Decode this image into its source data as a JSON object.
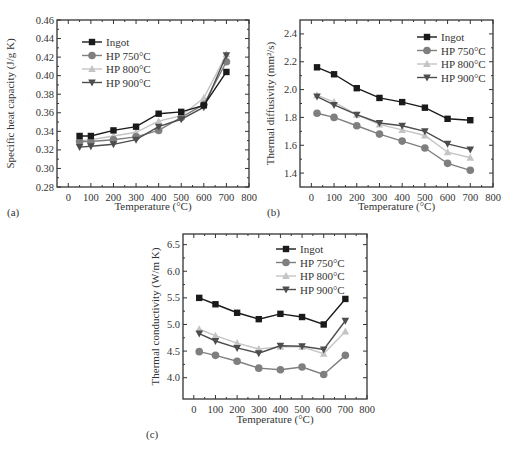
{
  "colors": {
    "Ingot": "#1a1a1a",
    "HP 750°C": "#7f7f7f",
    "HP 800°C": "#c4c4c4",
    "HP 900°C": "#4d4d4d",
    "axis": "#333333"
  },
  "chart_data": [
    {
      "panel": "(a)",
      "type": "line",
      "title": "",
      "xlabel": "Temperature (°C)",
      "ylabel": "Specific heat capacity (J/g K)",
      "xlim": [
        -50,
        800
      ],
      "ylim": [
        0.28,
        0.46
      ],
      "xticks": [
        0,
        100,
        200,
        300,
        400,
        500,
        600,
        700,
        800
      ],
      "yticks": [
        0.28,
        0.3,
        0.32,
        0.34,
        0.36,
        0.38,
        0.4,
        0.42,
        0.44,
        0.46
      ],
      "ytick_labels": [
        "0.28",
        "0.30",
        "0.32",
        "0.34",
        "0.36",
        "0.38",
        "0.40",
        "0.42",
        "0.44",
        "0.46"
      ],
      "grid": false,
      "legend_position": "upper left",
      "x": [
        50,
        100,
        200,
        300,
        400,
        500,
        600,
        700
      ],
      "series": [
        {
          "name": "Ingot",
          "marker": "square",
          "values": [
            0.335,
            0.335,
            0.341,
            0.345,
            0.359,
            0.361,
            0.368,
            0.404
          ]
        },
        {
          "name": "HP 750°C",
          "marker": "circle",
          "values": [
            0.329,
            0.329,
            0.331,
            0.334,
            0.341,
            0.355,
            0.369,
            0.415
          ]
        },
        {
          "name": "HP 800°C",
          "marker": "triangle-up",
          "values": [
            0.33,
            0.331,
            0.335,
            0.339,
            0.351,
            0.357,
            0.376,
            0.423
          ]
        },
        {
          "name": "HP 900°C",
          "marker": "triangle-down",
          "values": [
            0.323,
            0.324,
            0.326,
            0.331,
            0.345,
            0.353,
            0.366,
            0.422
          ]
        }
      ]
    },
    {
      "panel": "(b)",
      "type": "line",
      "title": "",
      "xlabel": "Temperature (°C)",
      "ylabel": "Thermal diffusivity (mm²/s)",
      "xlim": [
        -50,
        800
      ],
      "ylim": [
        1.3,
        2.5
      ],
      "xticks": [
        0,
        100,
        200,
        300,
        400,
        500,
        600,
        700,
        800
      ],
      "yticks": [
        1.4,
        1.6,
        1.8,
        2.0,
        2.2,
        2.4
      ],
      "ytick_labels": [
        "1.4",
        "1.6",
        "1.8",
        "2.0",
        "2.2",
        "2.4"
      ],
      "grid": false,
      "legend_position": "upper right",
      "x": [
        25,
        100,
        200,
        300,
        400,
        500,
        600,
        700
      ],
      "series": [
        {
          "name": "Ingot",
          "marker": "square",
          "values": [
            2.16,
            2.11,
            2.01,
            1.94,
            1.91,
            1.87,
            1.79,
            1.78
          ]
        },
        {
          "name": "HP 750°C",
          "marker": "circle",
          "values": [
            1.83,
            1.8,
            1.74,
            1.68,
            1.63,
            1.58,
            1.47,
            1.42
          ]
        },
        {
          "name": "HP 800°C",
          "marker": "triangle-up",
          "values": [
            1.96,
            1.91,
            1.82,
            1.75,
            1.71,
            1.67,
            1.55,
            1.51
          ]
        },
        {
          "name": "HP 900°C",
          "marker": "triangle-down",
          "values": [
            1.95,
            1.89,
            1.82,
            1.76,
            1.74,
            1.7,
            1.61,
            1.57
          ]
        }
      ]
    },
    {
      "panel": "(c)",
      "type": "line",
      "title": "",
      "xlabel": "Temperature (°C)",
      "ylabel": "Thermal conductivity (W/m K)",
      "xlim": [
        -50,
        800
      ],
      "ylim": [
        3.6,
        6.7
      ],
      "xticks": [
        0,
        100,
        200,
        300,
        400,
        500,
        600,
        700,
        800
      ],
      "yticks": [
        4.0,
        4.5,
        5.0,
        5.5,
        6.0,
        6.5
      ],
      "ytick_labels": [
        "4.0",
        "4.5",
        "5.0",
        "5.5",
        "6.0",
        "6.5"
      ],
      "grid": false,
      "legend_position": "upper right",
      "x": [
        25,
        100,
        200,
        300,
        400,
        500,
        600,
        700
      ],
      "series": [
        {
          "name": "Ingot",
          "marker": "square",
          "values": [
            5.5,
            5.38,
            5.22,
            5.1,
            5.2,
            5.14,
            5.0,
            5.48
          ]
        },
        {
          "name": "HP 750°C",
          "marker": "circle",
          "values": [
            4.49,
            4.42,
            4.31,
            4.18,
            4.15,
            4.2,
            4.06,
            4.42
          ]
        },
        {
          "name": "HP 800°C",
          "marker": "triangle-up",
          "values": [
            4.91,
            4.79,
            4.65,
            4.54,
            4.58,
            4.58,
            4.45,
            4.87
          ]
        },
        {
          "name": "HP 900°C",
          "marker": "triangle-down",
          "values": [
            4.83,
            4.69,
            4.56,
            4.46,
            4.6,
            4.59,
            4.53,
            5.07
          ]
        }
      ]
    }
  ],
  "panels": [
    {
      "label": "(a)"
    },
    {
      "label": "(b)"
    },
    {
      "label": "(c)"
    }
  ]
}
